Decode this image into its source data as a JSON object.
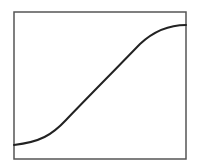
{
  "diagram": {
    "type": "sigmoid-curve",
    "frame": {
      "x": 14,
      "y": 12,
      "width": 172,
      "height": 147,
      "stroke": "#555555"
    },
    "curve": {
      "stroke": "#222222",
      "points": [
        [
          14,
          145
        ],
        [
          35,
          141
        ],
        [
          58,
          128
        ],
        [
          80,
          106
        ],
        [
          100,
          86
        ],
        [
          128,
          58
        ],
        [
          145,
          40
        ],
        [
          165,
          28
        ],
        [
          186,
          25
        ]
      ]
    }
  }
}
